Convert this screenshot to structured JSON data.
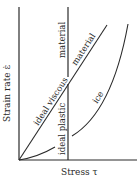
{
  "diagram": {
    "axes": {
      "x_label": "Stress τ",
      "y_label": "Strain rate ε̇"
    },
    "curves": [
      {
        "id": "ideal-viscous",
        "label": "ideal viscous",
        "continuation_label": "material",
        "shape": "straight line through origin"
      },
      {
        "id": "ideal-plastic",
        "label": "ideal plastic",
        "continuation_label": "material",
        "shape": "vertical line at yield stress"
      },
      {
        "id": "ice",
        "label": "ice",
        "shape": "nonlinear curve, concave up"
      },
      {
        "id": "near-origin",
        "label": "",
        "shape": "short curve from origin"
      }
    ],
    "colors": {
      "line": "#2a2a2a",
      "background": "#ffffff"
    }
  }
}
